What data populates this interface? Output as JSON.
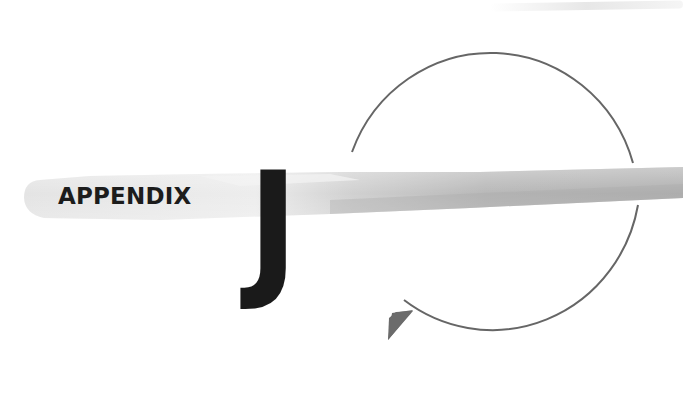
{
  "heading": {
    "label": "APPENDIX",
    "letter": "J"
  },
  "decorations": {
    "brush_stroke": "gray-brush-stroke",
    "arrow": "circular-arrow-counterclockwise",
    "arrow_color": "#6b6b6b",
    "brush_color": "#b5b5b5"
  }
}
